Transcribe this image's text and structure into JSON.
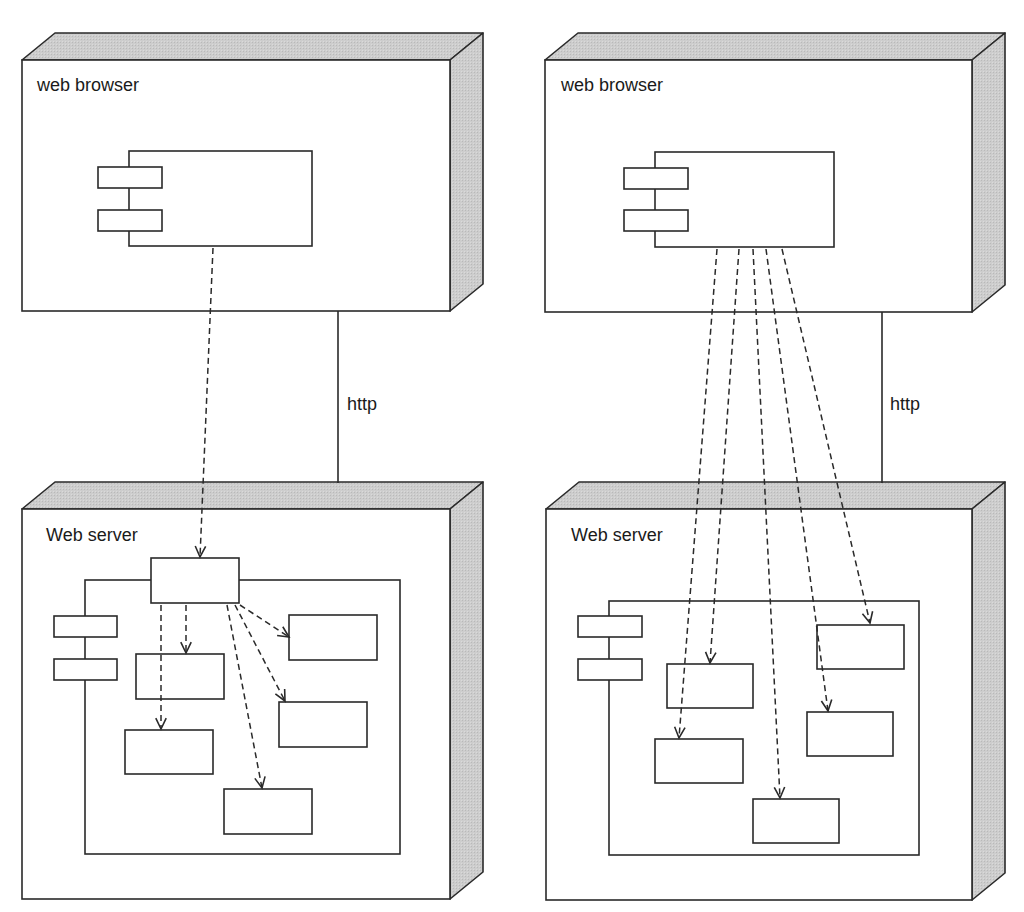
{
  "colors": {
    "line": "#2a2a2a",
    "face": "#ffffff",
    "shade": "#c8c8c8",
    "text": "#1a1a1a"
  },
  "depth": {
    "dx": 33,
    "dy": 27
  },
  "diagrams": [
    {
      "name": "facade-deployment",
      "browser_node": {
        "label": "web browser",
        "x": 22,
        "y": 60,
        "w": 428,
        "h": 251,
        "label_pos": [
          37,
          91
        ]
      },
      "front_end": {
        "label": "Web front end",
        "x": 129,
        "y": 151,
        "w": 183,
        "h": 95,
        "ports": [
          {
            "x": 98,
            "y": 167,
            "w": 64,
            "h": 21
          },
          {
            "x": 98,
            "y": 210,
            "w": 64,
            "h": 21
          }
        ],
        "label_pos": [
          232,
          206
        ]
      },
      "connection": {
        "label": "http",
        "x": 338,
        "y1": 311,
        "y2": 483,
        "label_pos": [
          347,
          410
        ]
      },
      "server_node": {
        "label": "Web server",
        "x": 22,
        "y": 509,
        "w": 428,
        "h": 390,
        "label_pos": [
          46,
          541
        ]
      },
      "server_component": {
        "x": 85,
        "y": 580,
        "w": 315,
        "h": 274,
        "ports": [
          {
            "x": 54,
            "y": 616,
            "w": 63,
            "h": 21
          },
          {
            "x": 54,
            "y": 659,
            "w": 63,
            "h": 21
          }
        ]
      },
      "facade": {
        "label": "Facade",
        "x": 151,
        "y": 558,
        "w": 88,
        "h": 45,
        "label_pos": [
          195,
          588
        ]
      },
      "inner_boxes": [
        {
          "x": 136,
          "y": 654,
          "w": 88,
          "h": 45
        },
        {
          "x": 125,
          "y": 730,
          "w": 88,
          "h": 44
        },
        {
          "x": 224,
          "y": 789,
          "w": 88,
          "h": 45
        },
        {
          "x": 289,
          "y": 615,
          "w": 88,
          "h": 45
        },
        {
          "x": 279,
          "y": 702,
          "w": 88,
          "h": 45
        }
      ],
      "dependencies": [
        {
          "from": [
            213,
            248
          ],
          "to": [
            200,
            557
          ]
        },
        {
          "from": [
            186,
            605
          ],
          "to": [
            186,
            653
          ]
        },
        {
          "from": [
            161,
            605
          ],
          "to": [
            161,
            729
          ]
        },
        {
          "from": [
            227,
            605
          ],
          "to": [
            262,
            788
          ]
        },
        {
          "from": [
            235,
            605
          ],
          "to": [
            285,
            701
          ]
        },
        {
          "from": [
            240,
            605
          ],
          "to": [
            289,
            637
          ]
        }
      ]
    },
    {
      "name": "direct-deployment",
      "browser_node": {
        "label": "web browser",
        "x": 545,
        "y": 60,
        "w": 427,
        "h": 252,
        "label_pos": [
          561,
          91
        ]
      },
      "front_end": {
        "label": "Web front end",
        "x": 655,
        "y": 152,
        "w": 179,
        "h": 95,
        "ports": [
          {
            "x": 624,
            "y": 168,
            "w": 64,
            "h": 21
          },
          {
            "x": 624,
            "y": 210,
            "w": 64,
            "h": 21
          }
        ],
        "label_pos": [
          757,
          206
        ]
      },
      "connection": {
        "label": "http",
        "x": 882,
        "y1": 312,
        "y2": 483,
        "label_pos": [
          890,
          410
        ]
      },
      "server_node": {
        "label": "Web server",
        "x": 546,
        "y": 509,
        "w": 426,
        "h": 391,
        "label_pos": [
          571,
          541
        ]
      },
      "server_component": {
        "x": 609,
        "y": 601,
        "w": 310,
        "h": 254,
        "ports": [
          {
            "x": 578,
            "y": 616,
            "w": 64,
            "h": 21
          },
          {
            "x": 578,
            "y": 659,
            "w": 64,
            "h": 21
          }
        ]
      },
      "facade": null,
      "inner_boxes": [
        {
          "x": 667,
          "y": 664,
          "w": 86,
          "h": 44
        },
        {
          "x": 655,
          "y": 739,
          "w": 88,
          "h": 44
        },
        {
          "x": 753,
          "y": 799,
          "w": 86,
          "h": 44
        },
        {
          "x": 817,
          "y": 625,
          "w": 87,
          "h": 44
        },
        {
          "x": 807,
          "y": 712,
          "w": 86,
          "h": 44
        }
      ],
      "dependencies": [
        {
          "from": [
            717,
            249
          ],
          "to": [
            679,
            738
          ]
        },
        {
          "from": [
            739,
            249
          ],
          "to": [
            710,
            663
          ]
        },
        {
          "from": [
            753,
            249
          ],
          "to": [
            780,
            798
          ]
        },
        {
          "from": [
            766,
            249
          ],
          "to": [
            828,
            711
          ]
        },
        {
          "from": [
            782,
            249
          ],
          "to": [
            870,
            623
          ]
        }
      ]
    }
  ]
}
